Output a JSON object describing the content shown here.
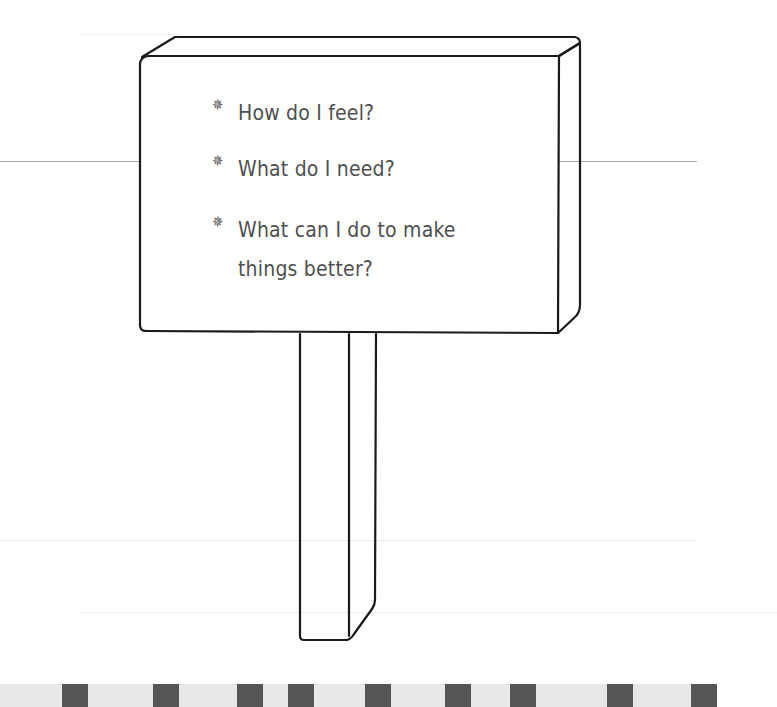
{
  "sign": {
    "items": [
      {
        "bullet": "✵",
        "text": "How do I feel?"
      },
      {
        "bullet": "✵",
        "text": "What do I need?"
      },
      {
        "bullet": "✵",
        "text": "What can I do to make things better?"
      }
    ]
  },
  "colors": {
    "outline": "#1a1a1a",
    "text": "#4f4f4f",
    "band": "#e8e8e8",
    "band_block": "#555555",
    "rule_line": "#a8a8a8"
  },
  "bottom_band": {
    "block_positions_x": [
      62,
      153,
      237,
      288,
      365,
      445,
      510,
      607,
      691
    ]
  }
}
